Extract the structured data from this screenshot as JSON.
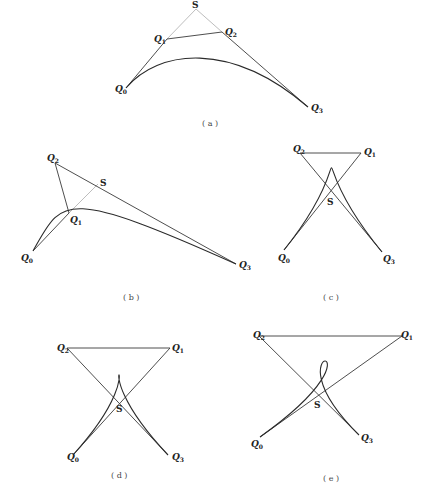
{
  "figure": {
    "panels": [
      {
        "id": "a",
        "caption": "( a )",
        "points": {
          "Q0": [
            126,
            88
          ],
          "Q1": [
            167,
            39
          ],
          "S": [
            196,
            9
          ],
          "Q2": [
            222,
            32
          ],
          "Q3": [
            308,
            107
          ]
        },
        "labels": {
          "Q0": "Q",
          "Q1": "Q",
          "Q2": "Q",
          "Q3": "Q",
          "S": "S"
        },
        "subscripts": {
          "Q0": "0",
          "Q1": "1",
          "Q2": "2",
          "Q3": "3"
        }
      },
      {
        "id": "b",
        "caption": "( b )",
        "points": {
          "Q0": [
            33,
            251
          ],
          "Q1": [
            69,
            213
          ],
          "S": [
            98,
            184
          ],
          "Q2": [
            55,
            163
          ],
          "Q3": [
            236,
            264
          ]
        },
        "labels": {
          "Q0": "Q",
          "Q1": "Q",
          "Q2": "Q",
          "Q3": "Q",
          "S": "S"
        },
        "subscripts": {
          "Q0": "0",
          "Q1": "1",
          "Q2": "2",
          "Q3": "3"
        }
      },
      {
        "id": "c",
        "caption": "( c )",
        "points": {
          "Q0": [
            284,
            250
          ],
          "Q1": [
            361,
            153
          ],
          "S": [
            330,
            192
          ],
          "Q2": [
            300,
            153
          ],
          "Q3": [
            382,
            252
          ]
        },
        "labels": {
          "Q0": "Q",
          "Q1": "Q",
          "Q2": "Q",
          "Q3": "Q",
          "S": "S"
        },
        "subscripts": {
          "Q0": "0",
          "Q1": "1",
          "Q2": "2",
          "Q3": "3"
        }
      },
      {
        "id": "d",
        "caption": "( d )",
        "points": {
          "Q0": [
            73,
            455
          ],
          "Q1": [
            170,
            348
          ],
          "S": [
            120,
            399
          ],
          "Q2": [
            67,
            348
          ],
          "Q3": [
            168,
            455
          ]
        },
        "labels": {
          "Q0": "Q",
          "Q1": "Q",
          "Q2": "Q",
          "Q3": "Q",
          "S": "S"
        },
        "subscripts": {
          "Q0": "0",
          "Q1": "1",
          "Q2": "2",
          "Q3": "3"
        }
      },
      {
        "id": "e",
        "caption": "( e )",
        "points": {
          "Q0": [
            260,
            437
          ],
          "Q1": [
            402,
            336
          ],
          "S": [
            318,
            397
          ],
          "Q2": [
            259,
            336
          ],
          "Q3": [
            359,
            435
          ]
        },
        "labels": {
          "Q0": "Q",
          "Q1": "Q",
          "Q2": "Q",
          "Q3": "Q",
          "S": "S"
        },
        "subscripts": {
          "Q0": "0",
          "Q1": "1",
          "Q2": "2",
          "Q3": "3"
        }
      }
    ]
  }
}
